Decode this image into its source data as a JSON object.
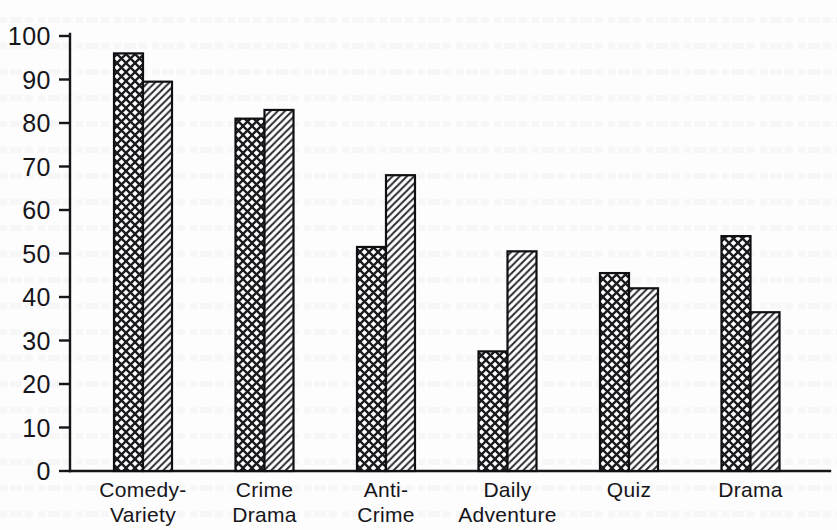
{
  "chart_data": {
    "type": "bar",
    "title": "",
    "subtitle": "",
    "xlabel": "",
    "ylabel": "",
    "ylim": [
      0,
      100
    ],
    "ytick_labels": [
      "0",
      "10",
      "20",
      "30",
      "40",
      "50",
      "60",
      "70",
      "80",
      "90",
      "100"
    ],
    "ytick_values": [
      0,
      10,
      20,
      30,
      40,
      50,
      60,
      70,
      80,
      90,
      100
    ],
    "grid": false,
    "legend": "none",
    "categories": [
      "Comedy-\nVariety",
      "Crime\nDrama",
      "Anti-\nCrime",
      "Daily\nAdventure",
      "Quiz",
      "Drama"
    ],
    "category_lines": [
      [
        "Comedy-",
        "Variety"
      ],
      [
        "Crime",
        "Drama"
      ],
      [
        "Anti-",
        "Crime"
      ],
      [
        "Daily",
        "Adventure"
      ],
      [
        "Quiz",
        ""
      ],
      [
        "Drama",
        ""
      ]
    ],
    "series": [
      {
        "name": "series-1",
        "pattern": "crosshatch",
        "values": [
          96,
          81,
          51.5,
          27.5,
          45.5,
          54
        ]
      },
      {
        "name": "series-2",
        "pattern": "diagonal",
        "values": [
          89.5,
          83,
          68,
          50.5,
          42,
          36.5
        ]
      }
    ]
  },
  "colors": {
    "ink": "#15151a",
    "background": "#fdfdfd",
    "bar_fill": "#ffffff",
    "hatch": "#1a1a1f"
  },
  "geometry": {
    "baseline_y": 471,
    "top_y": 36,
    "axis_x": 70,
    "bar_width": 29,
    "group_pitch": 121.5,
    "first_group_x": 114
  }
}
